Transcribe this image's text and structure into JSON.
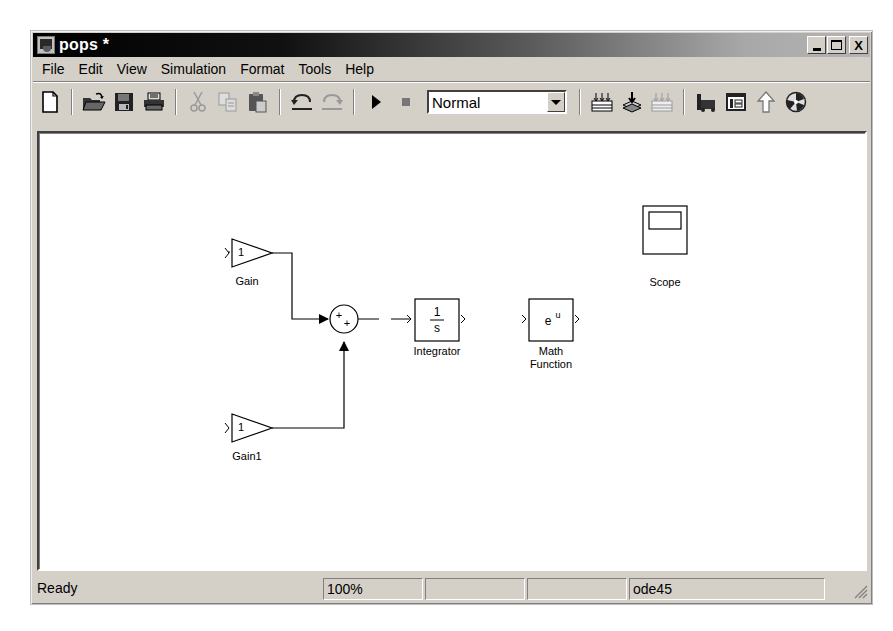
{
  "window": {
    "title": "pops *",
    "controls": {
      "minimize": "minimize",
      "maximize": "maximize",
      "close": "X"
    }
  },
  "menubar": {
    "items": [
      {
        "label": "File"
      },
      {
        "label": "Edit"
      },
      {
        "label": "View"
      },
      {
        "label": "Simulation"
      },
      {
        "label": "Format"
      },
      {
        "label": "Tools"
      },
      {
        "label": "Help"
      }
    ]
  },
  "toolbar": {
    "buttons": [
      {
        "icon": "new-document-icon"
      },
      {
        "icon": "open-folder-icon"
      },
      {
        "icon": "save-icon"
      },
      {
        "icon": "print-icon"
      },
      {
        "icon": "cut-icon"
      },
      {
        "icon": "copy-icon"
      },
      {
        "icon": "paste-icon"
      },
      {
        "icon": "undo-icon"
      },
      {
        "icon": "redo-icon"
      },
      {
        "icon": "start-simulation-icon"
      },
      {
        "icon": "stop-simulation-icon"
      },
      {
        "icon": "build-icon"
      },
      {
        "icon": "update-diagram-icon"
      },
      {
        "icon": "build-subsystem-icon"
      },
      {
        "icon": "library-browser-icon"
      },
      {
        "icon": "model-explorer-icon"
      },
      {
        "icon": "go-to-parent-icon"
      },
      {
        "icon": "debug-icon"
      }
    ],
    "simulation_mode": {
      "selected": "Normal"
    }
  },
  "diagram": {
    "blocks": [
      {
        "name": "Gain",
        "type": "gain",
        "value": "1"
      },
      {
        "name": "Gain1",
        "type": "gain",
        "value": "1"
      },
      {
        "name": "Sum",
        "type": "sum",
        "signs": "++"
      },
      {
        "name": "Integrator",
        "type": "integrator",
        "numerator": "1",
        "denominator": "s"
      },
      {
        "name": "Math Function",
        "line1": "Math",
        "line2": "Function",
        "type": "math",
        "expression_base": "e",
        "expression_exp": "u"
      },
      {
        "name": "Scope",
        "type": "scope"
      }
    ]
  },
  "statusbar": {
    "status": "Ready",
    "zoom": "100%",
    "pane3": "",
    "pane4": "",
    "solver": "ode45"
  }
}
